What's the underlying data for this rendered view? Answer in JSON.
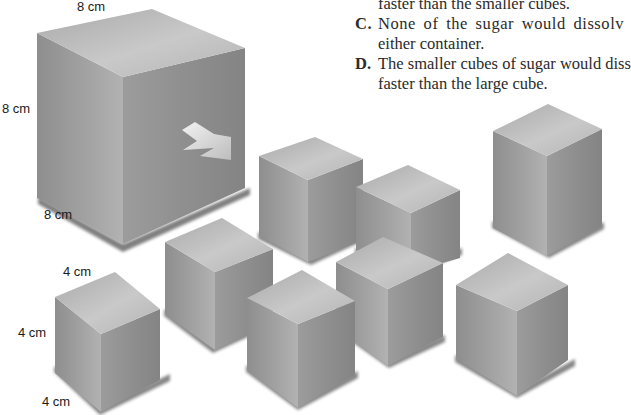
{
  "question": {
    "options": [
      {
        "letter": "",
        "lines": [
          "faster than the smaller cubes."
        ]
      },
      {
        "letter": "C.",
        "lines": [
          "None of the sugar would dissolv",
          "either container."
        ]
      },
      {
        "letter": "D.",
        "lines": [
          "The smaller cubes of sugar would diss",
          "faster than the large cube."
        ]
      }
    ]
  },
  "large_cube": {
    "top_label": "8 cm",
    "side_label": "8 cm",
    "depth_label": "8 cm"
  },
  "small_cube": {
    "top_label": "4 cm",
    "side_label": "4 cm",
    "depth_label": "4 cm"
  },
  "diagram": {
    "large_cube_count": 1,
    "small_cube_count": 8,
    "arrow": "arrow-right-down",
    "colors": {
      "top_face": "#bdbdbd",
      "left_face": "#9a9a9a",
      "right_face": "#8c8c8c",
      "shadow": "#5a5a5a"
    }
  }
}
